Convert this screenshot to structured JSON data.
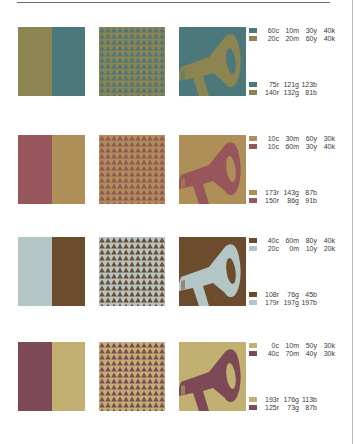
{
  "rows": [
    {
      "colorA": "#4b797b",
      "colorB": "#8c8451",
      "split_order": [
        "b",
        "a"
      ],
      "pattern": {
        "bg": "#8c8451",
        "fg": "#4b797b"
      },
      "illustration": {
        "bg": "#4b797b",
        "fg": "#8c8451"
      },
      "cmyk": [
        {
          "c": "60c",
          "m": "10m",
          "y": "30y",
          "k": "40k",
          "chip": "#4b797b"
        },
        {
          "c": "20c",
          "m": "20m",
          "y": "60y",
          "k": "40k",
          "chip": "#8c8451"
        }
      ],
      "rgb": [
        {
          "r": "75r",
          "g": "121g",
          "b": "123b",
          "chip": "#4b797b"
        },
        {
          "r": "140r",
          "g": "132g",
          "b": "81b",
          "chip": "#8c8451"
        }
      ]
    },
    {
      "colorA": "#ad8f57",
      "colorB": "#96565b",
      "split_order": [
        "b",
        "a"
      ],
      "pattern": {
        "bg": "#ad8f57",
        "fg": "#96565b"
      },
      "illustration": {
        "bg": "#ad8f57",
        "fg": "#96565b"
      },
      "cmyk": [
        {
          "c": "10c",
          "m": "30m",
          "y": "60y",
          "k": "30k",
          "chip": "#ad8f57"
        },
        {
          "c": "10c",
          "m": "60m",
          "y": "30y",
          "k": "40k",
          "chip": "#96565b"
        }
      ],
      "rgb": [
        {
          "r": "173r",
          "g": "143g",
          "b": "87b",
          "chip": "#ad8f57"
        },
        {
          "r": "150r",
          "g": "86g",
          "b": "91b",
          "chip": "#96565b"
        }
      ]
    },
    {
      "colorA": "#6c4c2d",
      "colorB": "#b3c5c5",
      "split_order": [
        "b",
        "a"
      ],
      "pattern": {
        "bg": "#b3c5c5",
        "fg": "#6c4c2d"
      },
      "illustration": {
        "bg": "#6c4c2d",
        "fg": "#b3c5c5"
      },
      "cmyk": [
        {
          "c": "40c",
          "m": "60m",
          "y": "80y",
          "k": "40k",
          "chip": "#6c4c2d"
        },
        {
          "c": "20c",
          "m": "0m",
          "y": "10y",
          "k": "20k",
          "chip": "#b3c5c5"
        }
      ],
      "rgb": [
        {
          "r": "108r",
          "g": "76g",
          "b": "45b",
          "chip": "#6c4c2d"
        },
        {
          "r": "179r",
          "g": "197g",
          "b": "197b",
          "chip": "#b3c5c5"
        }
      ]
    },
    {
      "colorA": "#c1b071",
      "colorB": "#7d4957",
      "split_order": [
        "b",
        "a"
      ],
      "pattern": {
        "bg": "#c1b071",
        "fg": "#7d4957"
      },
      "illustration": {
        "bg": "#c1b071",
        "fg": "#7d4957"
      },
      "cmyk": [
        {
          "c": "0c",
          "m": "10m",
          "y": "50y",
          "k": "30k",
          "chip": "#c1b071"
        },
        {
          "c": "40c",
          "m": "70m",
          "y": "40y",
          "k": "30k",
          "chip": "#7d4957"
        }
      ],
      "rgb": [
        {
          "r": "193r",
          "g": "176g",
          "b": "113b",
          "chip": "#c1b071"
        },
        {
          "r": "125r",
          "g": "73g",
          "b": "87b",
          "chip": "#7d4957"
        }
      ]
    }
  ]
}
